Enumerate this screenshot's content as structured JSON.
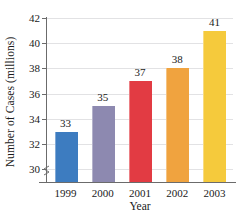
{
  "chart_data": {
    "type": "bar",
    "title": "",
    "xlabel": "Year",
    "ylabel": "Number of Cases (millions)",
    "categories": [
      "1999",
      "2000",
      "2001",
      "2002",
      "2003"
    ],
    "values": [
      33,
      35,
      37,
      38,
      41
    ],
    "value_labels": [
      "33",
      "35",
      "37",
      "38",
      "41"
    ],
    "ylim": [
      29,
      42
    ],
    "y_ticks": [
      30,
      32,
      34,
      36,
      38,
      40,
      42
    ],
    "y_tick_labels": [
      "30",
      "32",
      "34",
      "36",
      "38",
      "40",
      "42"
    ],
    "grid": true,
    "grid_axis": "y",
    "legend": false,
    "axis_break": true,
    "bar_colors": [
      "#3d7cc0",
      "#8d89b0",
      "#e23b43",
      "#f0a33f",
      "#f5ca3c"
    ],
    "series": [
      {
        "name": "Number of Cases (millions)",
        "values": [
          33,
          35,
          37,
          38,
          41
        ]
      }
    ],
    "points": [
      {
        "category": "1999",
        "value": 33,
        "color": "#3d7cc0"
      },
      {
        "category": "2000",
        "value": 35,
        "color": "#8d89b0"
      },
      {
        "category": "2001",
        "value": 37,
        "color": "#e23b43"
      },
      {
        "category": "2002",
        "value": 38,
        "color": "#f0a33f"
      },
      {
        "category": "2003",
        "value": 41,
        "color": "#f5ca3c"
      }
    ],
    "colors": {
      "gridline": "#e2e2e4",
      "axis": "#6b6b6b",
      "text": "#1a1a1a",
      "background": "#ffffff"
    }
  }
}
